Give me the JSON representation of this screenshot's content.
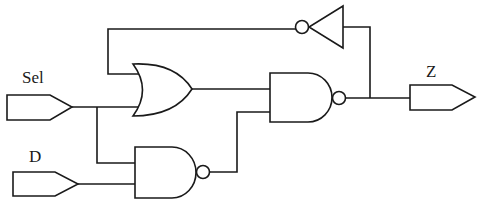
{
  "diagram": {
    "type": "logic-circuit",
    "inputs": [
      {
        "id": "sel",
        "label": "Sel"
      },
      {
        "id": "d",
        "label": "D"
      }
    ],
    "outputs": [
      {
        "id": "z",
        "label": "Z"
      }
    ],
    "gates": [
      {
        "id": "or1",
        "type": "OR",
        "inputs": [
          "inv1.out",
          "sel"
        ]
      },
      {
        "id": "nand1",
        "type": "NAND",
        "inputs": [
          "or1.out",
          "nand2.out"
        ]
      },
      {
        "id": "nand2",
        "type": "NAND",
        "inputs": [
          "sel",
          "d"
        ]
      },
      {
        "id": "inv1",
        "type": "NOT",
        "inputs": [
          "nand1.out"
        ]
      }
    ],
    "output_source": "nand1.out",
    "colors": {
      "line": "#1a1a1a",
      "background": "#ffffff"
    }
  }
}
